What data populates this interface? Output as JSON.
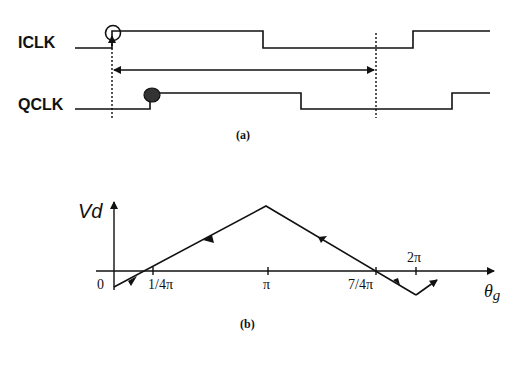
{
  "panel_a": {
    "signals": [
      {
        "name": "ICLK",
        "marker": "open-circle"
      },
      {
        "name": "QCLK",
        "marker": "filled-circle"
      }
    ],
    "caption": "(a)"
  },
  "panel_b": {
    "y_label": "Vd",
    "x_label": "θ",
    "x_label_sub": "g",
    "origin_label": "0",
    "ticks": [
      {
        "label": "1/4π",
        "pos": "below"
      },
      {
        "label": "π",
        "pos": "below"
      },
      {
        "label": "7/4π",
        "pos": "below"
      },
      {
        "label": "2π",
        "pos": "above"
      }
    ],
    "caption": "(b)"
  },
  "colors": {
    "ink": "#111111",
    "background": "#ffffff"
  }
}
